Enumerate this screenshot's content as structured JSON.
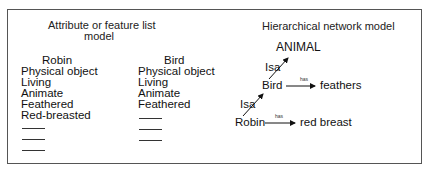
{
  "left_panel": {
    "title_line1": "Attribute or feature list",
    "title_line2": "model",
    "robin": {
      "header": "Robin",
      "features": [
        "Physical object",
        "Living",
        "Animate",
        "Feathered",
        "Red-breasted"
      ],
      "blank_lines": 3
    },
    "bird": {
      "header": "Bird",
      "features": [
        "Physical object",
        "Living",
        "Animate",
        "Feathered"
      ],
      "blank_lines": 3
    }
  },
  "right_panel": {
    "title": "Hierarchical network model",
    "nodes": {
      "animal": "ANIMAL",
      "bird": "Bird",
      "robin": "Robin",
      "feathers": "feathers",
      "red_breast": "red breast"
    },
    "edges": {
      "bird_isa": "Isa",
      "robin_isa": "Isa",
      "bird_has": "has",
      "robin_has": "has"
    }
  }
}
